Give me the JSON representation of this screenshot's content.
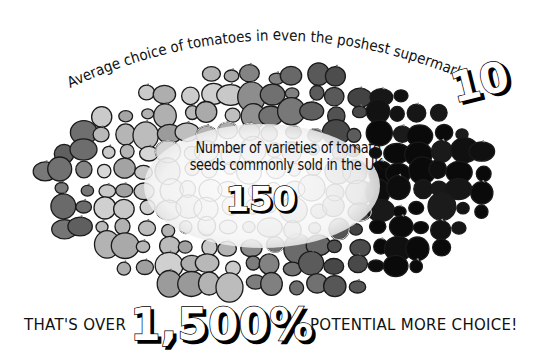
{
  "infographic": {
    "top_caption": "Average choice of tomatoes in even the poshest supermarkets:",
    "top_number": "10",
    "center_caption_line1": "Number of varieties of tomato",
    "center_caption_line2": "seeds commonly sold in the UK:",
    "center_number": "150",
    "bottom_prefix": "THAT'S OVER",
    "bottom_number": "1,500%",
    "bottom_suffix": "POTENTIAL MORE CHOICE!"
  },
  "colors": {
    "background": "#ffffff",
    "text": "#111111",
    "outline": "#1a1a1a",
    "center_ellipse": "#f4f4f4",
    "shade_light": "#d8d8d8",
    "shade_mid": "#8a8a8a",
    "shade_dark": "#555555",
    "shade_black": "#0d0d0d"
  },
  "chart_data": {
    "type": "pictograph",
    "categories": [
      "Supermarket average choice",
      "Seed varieties sold in UK"
    ],
    "values": [
      10,
      150
    ],
    "annotation": "That's over 1,500% potential more choice!",
    "unit": "varieties"
  }
}
